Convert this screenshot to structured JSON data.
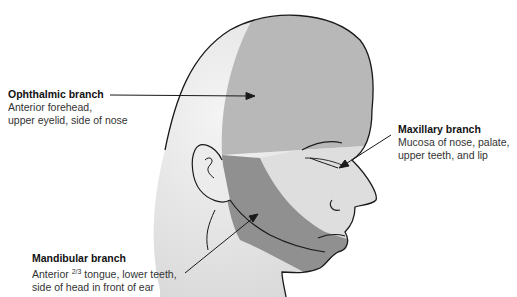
{
  "diagram": {
    "colors": {
      "skin_light": "#e8e8e8",
      "ophthalmic": "#b4b4b4",
      "maxillary": "#dcdcdc",
      "mandibular": "#8e8e8e",
      "outline": "#1a1a1a",
      "background": "#ffffff"
    },
    "labels": [
      {
        "id": "ophthalmic",
        "title": "Ophthalmic branch",
        "desc_line1": "Anterior forehead,",
        "desc_line2": "upper eyelid, side of nose"
      },
      {
        "id": "maxillary",
        "title": "Maxillary branch",
        "desc_line1": "Mucosa of nose, palate,",
        "desc_line2": "upper teeth, and lip"
      },
      {
        "id": "mandibular",
        "title": "Mandibular branch",
        "desc_line1_pre": "Anterior ",
        "desc_line1_frac": "2/3",
        "desc_line1_post": " tongue, lower teeth,",
        "desc_line2": "side of head in front of ear"
      }
    ]
  }
}
